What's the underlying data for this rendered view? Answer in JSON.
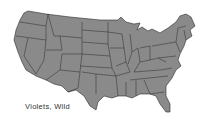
{
  "map": {
    "title": "Violets, Wild",
    "region": "Contiguous United States",
    "fill_color": "#8a8a8a",
    "border_color": "#2a2a2a",
    "background_color": "#ffffff"
  }
}
